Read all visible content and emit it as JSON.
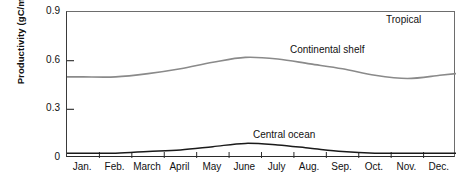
{
  "chart_data": {
    "type": "line",
    "title": "",
    "region_label": "Tropical",
    "xlabel": "",
    "ylabel": "Productivity (gC/m2/day)",
    "ylabel_parts": {
      "prefix": "Productivity (gC/m",
      "sup": "2",
      "suffix": "/day)"
    },
    "categories": [
      "Jan.",
      "Feb.",
      "March",
      "April",
      "May",
      "June",
      "July",
      "Aug.",
      "Sep.",
      "Oct.",
      "Nov.",
      "Dec."
    ],
    "ylim": [
      0,
      0.9
    ],
    "yticks": [
      "0.9",
      "0.6",
      "0.3",
      "0"
    ],
    "ytick_values": [
      0.9,
      0.6,
      0.3,
      0
    ],
    "grid": false,
    "legend": "inline-annotations",
    "series": [
      {
        "name": "Continental shelf",
        "color": "#8a8a8a",
        "values": [
          0.5,
          0.5,
          0.52,
          0.55,
          0.59,
          0.62,
          0.61,
          0.58,
          0.55,
          0.51,
          0.49,
          0.51
        ]
      },
      {
        "name": "Central ocean",
        "color": "#1a1a1a",
        "values": [
          0.03,
          0.03,
          0.04,
          0.05,
          0.07,
          0.09,
          0.08,
          0.06,
          0.04,
          0.03,
          0.03,
          0.03
        ]
      }
    ],
    "annotations": [
      {
        "text": "Tropical",
        "x": "Dec.",
        "y": 0.86
      },
      {
        "text": "Continental shelf",
        "x": "Aug.",
        "y": 0.69
      },
      {
        "text": "Central ocean",
        "x": "July",
        "y": 0.18
      }
    ]
  },
  "axes": {
    "y": {
      "ticks": [
        {
          "label": "0.9",
          "value": 0.9
        },
        {
          "label": "0.6",
          "value": 0.6
        },
        {
          "label": "0.3",
          "value": 0.3
        },
        {
          "label": "0",
          "value": 0
        }
      ]
    },
    "x": {
      "ticks": [
        {
          "label": "Jan."
        },
        {
          "label": "Feb."
        },
        {
          "label": "March"
        },
        {
          "label": "April"
        },
        {
          "label": "May"
        },
        {
          "label": "June"
        },
        {
          "label": "July"
        },
        {
          "label": "Aug."
        },
        {
          "label": "Sep."
        },
        {
          "label": "Oct."
        },
        {
          "label": "Nov."
        },
        {
          "label": "Dec."
        }
      ]
    }
  }
}
